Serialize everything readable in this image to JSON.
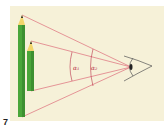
{
  "figure": {
    "number": "7",
    "angle_labels": {
      "alpha1": "α₁",
      "alpha2": "α₂"
    }
  },
  "colors": {
    "panel_bg": "#f6f1d8",
    "page_bg": "#ffffff",
    "ray_color": "#d9566a",
    "arc_color": "#b8334a",
    "pencil_green": "#4aa63a",
    "pencil_dark": "#2f7a27",
    "pencil_wood": "#f2d56b",
    "pencil_lead": "#222222",
    "eye_outline": "#555555"
  }
}
